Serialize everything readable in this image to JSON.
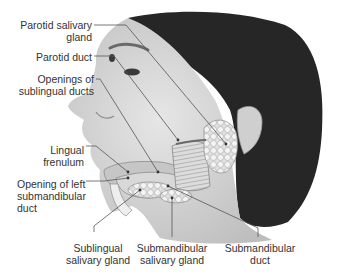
{
  "figure": {
    "colors": {
      "skin": "#d9d9d9",
      "hair": "#1e1e1e",
      "gland": "#ededed",
      "leader_line": "#555555",
      "text": "#333333"
    }
  },
  "labels": {
    "parotid_gland": {
      "line1": "Parotid salivary",
      "line2": "gland"
    },
    "parotid_duct": {
      "line1": "Parotid duct"
    },
    "sublingual_openings": {
      "line1": "Openings of",
      "line2": "sublingual ducts"
    },
    "lingual_frenulum": {
      "line1": "Lingual",
      "line2": "frenulum"
    },
    "submandibular_opening": {
      "line1": "Opening of left",
      "line2": "submandibular",
      "line3": "duct"
    },
    "sublingual_gland": {
      "line1": "Sublingual",
      "line2": "salivary gland"
    },
    "submandibular_gland": {
      "line1": "Submandibular",
      "line2": "salivary gland"
    },
    "submandibular_duct": {
      "line1": "Submandibular",
      "line2": "duct"
    }
  }
}
